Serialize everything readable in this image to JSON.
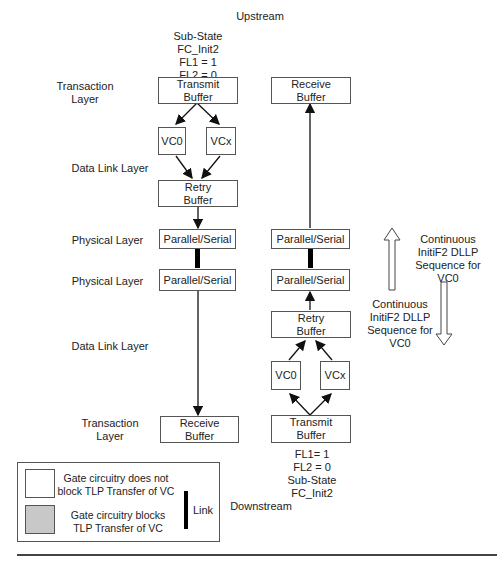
{
  "labels": {
    "upstream": "Upstream",
    "downstream": "Downstream",
    "upstream_state": [
      "Sub-State",
      "FC_Init2",
      "FL1 = 1",
      "FL2 = 0"
    ],
    "downstream_state": [
      "FL1= 1",
      "FL2 = 0",
      "Sub-State",
      "FC_Init2"
    ]
  },
  "layers": {
    "transaction_top": [
      "Transaction",
      "Layer"
    ],
    "data_link_top": "Data Link Layer",
    "physical_top": "Physical Layer",
    "physical_bottom": "Physical Layer",
    "data_link_bottom": "Data Link Layer",
    "transaction_bottom": [
      "Transaction",
      "Layer"
    ]
  },
  "boxes": {
    "up_transmit": [
      "Transmit",
      "Buffer"
    ],
    "up_vc0": "VC0",
    "up_vcx": "VCx",
    "up_retry": [
      "Retry",
      "Buffer"
    ],
    "up_ps": "Parallel/Serial",
    "down_ps_left": "Parallel/Serial",
    "down_receive_left": [
      "Receive",
      "Buffer"
    ],
    "up_receive": [
      "Receive",
      "Buffer"
    ],
    "up_ps_right": "Parallel/Serial",
    "down_ps_right": "Parallel/Serial",
    "down_retry": [
      "Retry",
      "Buffer"
    ],
    "down_vc0": "VC0",
    "down_vcx": "VCx",
    "down_transmit": [
      "Transmit",
      "Buffer"
    ]
  },
  "dllp": {
    "up_text": [
      "Continuous",
      "InitiF2 DLLP",
      "Sequence for",
      "VC0"
    ],
    "down_text": [
      "Continuous",
      "InitiF2 DLLP",
      "Sequence for",
      "VC0"
    ]
  },
  "legend": {
    "not_block": [
      "Gate circuitry does not",
      "block TLP Transfer of VC"
    ],
    "block": [
      "Gate circuitry blocks",
      "TLP Transfer of VC"
    ],
    "link": "Link",
    "block_color": "#c8c8c8"
  }
}
